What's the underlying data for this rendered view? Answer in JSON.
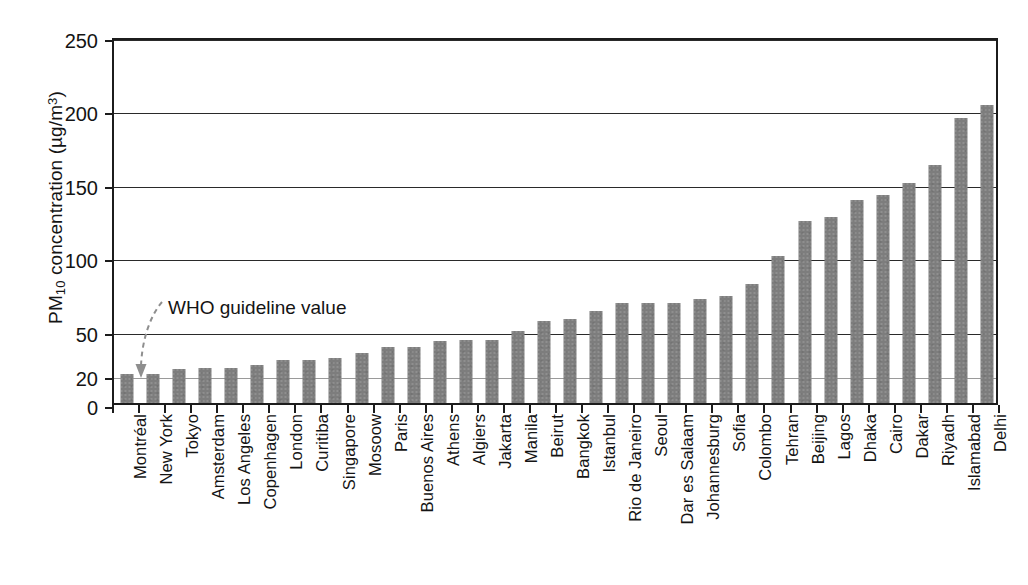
{
  "chart_data": {
    "type": "bar",
    "title": "",
    "xlabel": "",
    "ylabel": "PM10 concentration (µg/m3)",
    "ylabel_parts": {
      "prefix": "PM",
      "subscript": "10",
      "middle": " concentration (µg/m",
      "superscript": "3",
      "suffix": ")"
    },
    "ylim": [
      0,
      250
    ],
    "ytick_labels": [
      "0",
      "20",
      "50",
      "100",
      "150",
      "200",
      "250"
    ],
    "ytick_values": [
      0,
      20,
      50,
      100,
      150,
      200,
      250
    ],
    "grid": "horizontal gridlines at 50, 100, 150, 200, 250 (dark) and a faint line at 20",
    "legend": "none",
    "bar_color": "#7d7d7d",
    "axis_color": "#1c1c1c",
    "annotations": [
      {
        "text": "WHO guideline value",
        "target_value": 20,
        "target_category": "Montréal",
        "style": "dashed curved arrow pointing down to the 20 µg/m3 line"
      }
    ],
    "categories": [
      "Montréal",
      "New York",
      "Tokyo",
      "Amsterdam",
      "Los Angeles",
      "Copenhagen",
      "London",
      "Curitiba",
      "Singapore",
      "Mosoow",
      "Paris",
      "Buenos Aires",
      "Athens",
      "Algiers",
      "Jakarta",
      "Manila",
      "Beirut",
      "Bangkok",
      "Istanbul",
      "Rio de Janeiro",
      "Seoul",
      "Dar es Salaam",
      "Johannesburg",
      "Sofia",
      "Colombo",
      "Tehran",
      "Beijing",
      "Lagos",
      "Dhaka",
      "Cairo",
      "Dakar",
      "Riyadh",
      "Islamabad",
      "Delhi"
    ],
    "values": [
      20,
      20,
      23,
      24,
      24,
      26,
      29,
      29,
      31,
      34,
      38,
      38,
      42,
      43,
      43,
      49,
      56,
      57,
      63,
      68,
      68,
      68,
      71,
      73,
      81,
      100,
      124,
      127,
      138,
      142,
      150,
      162,
      194,
      203
    ]
  }
}
